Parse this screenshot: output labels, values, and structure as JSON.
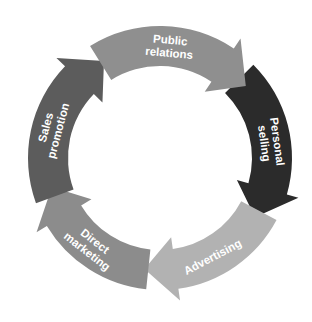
{
  "diagram": {
    "type": "cycle",
    "direction": "clockwise",
    "center": [
      160,
      158
    ],
    "outer_radius": 132,
    "inner_radius": 92,
    "segments": [
      {
        "id": "public-relations",
        "lines": [
          "Public",
          "relations"
        ],
        "color": "#8f8f8f",
        "start_deg": -122,
        "end_deg": -40,
        "label_deg": -85
      },
      {
        "id": "personal-selling",
        "lines": [
          "Personal",
          "selling"
        ],
        "color": "#2b2b2b",
        "start_deg": -45,
        "end_deg": 32,
        "label_deg": -8
      },
      {
        "id": "advertising",
        "lines": [
          "Advertising"
        ],
        "color": "#b2b2b2",
        "start_deg": 28,
        "end_deg": 98,
        "label_deg": 62
      },
      {
        "id": "direct-marketing",
        "lines": [
          "Direct",
          "marketing"
        ],
        "color": "#8c8c8c",
        "start_deg": 96,
        "end_deg": 165,
        "label_deg": 128
      },
      {
        "id": "sales-promotion",
        "lines": [
          "Sales",
          "promotion"
        ],
        "color": "#5c5c5c",
        "start_deg": 160,
        "end_deg": 240,
        "label_deg": 195
      }
    ]
  }
}
